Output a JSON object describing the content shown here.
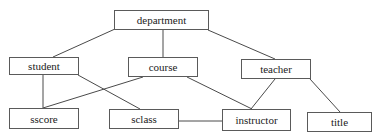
{
  "diagram": {
    "nodes": [
      {
        "id": "department",
        "label": "department",
        "x": 114,
        "y": 10,
        "w": 95,
        "h": 20
      },
      {
        "id": "student",
        "label": "student",
        "x": 9,
        "y": 57,
        "w": 70,
        "h": 18
      },
      {
        "id": "course",
        "label": "course",
        "x": 128,
        "y": 57,
        "w": 70,
        "h": 20
      },
      {
        "id": "teacher",
        "label": "teacher",
        "x": 241,
        "y": 59,
        "w": 70,
        "h": 20
      },
      {
        "id": "sscore",
        "label": "sscore",
        "x": 9,
        "y": 108,
        "w": 70,
        "h": 21
      },
      {
        "id": "sclass",
        "label": "sclass",
        "x": 109,
        "y": 109,
        "w": 70,
        "h": 20
      },
      {
        "id": "instructor",
        "label": "instructor",
        "x": 222,
        "y": 109,
        "w": 69,
        "h": 22
      },
      {
        "id": "title",
        "label": "title",
        "x": 307,
        "y": 112,
        "w": 65,
        "h": 20
      }
    ],
    "edges": [
      {
        "from": "department",
        "to": "student"
      },
      {
        "from": "department",
        "to": "course"
      },
      {
        "from": "department",
        "to": "teacher"
      },
      {
        "from": "student",
        "to": "sscore"
      },
      {
        "from": "student",
        "to": "sclass"
      },
      {
        "from": "course",
        "to": "sscore"
      },
      {
        "from": "course",
        "to": "instructor"
      },
      {
        "from": "teacher",
        "to": "instructor"
      },
      {
        "from": "teacher",
        "to": "title"
      },
      {
        "from": "sclass",
        "to": "instructor"
      }
    ]
  }
}
